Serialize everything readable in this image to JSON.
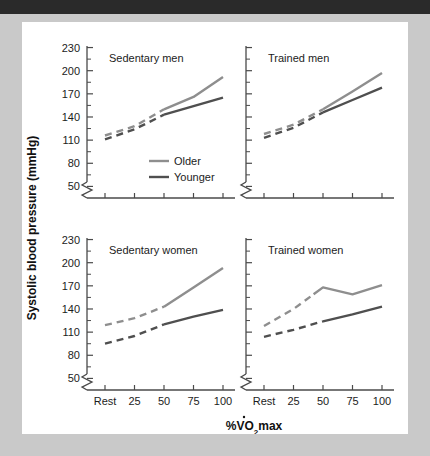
{
  "figure": {
    "y_axis_title": "Systolic blood pressure (mmHg)",
    "x_axis_title_pre": "%V",
    "x_axis_title_v": "V",
    "x_axis_title_mid": "O",
    "x_axis_title_sub": "2",
    "x_axis_title_post": "max"
  },
  "legend": {
    "older_label": "Older",
    "younger_label": "Younger",
    "older_color": "#8e8e8e",
    "younger_color": "#4f4f4f"
  },
  "chart_data": {
    "type": "line",
    "xlabel": "%VO2max",
    "ylabel": "Systolic blood pressure (mmHg)",
    "ylim": [
      35,
      230
    ],
    "y_ticks": [
      50,
      80,
      110,
      140,
      170,
      200,
      230
    ],
    "y_minor_ticks": [
      65,
      95,
      125,
      155,
      185,
      215
    ],
    "y_axis_break": true,
    "grid": false,
    "legend_position": "inside-top-left-panel",
    "x_categories": [
      "Rest",
      "25",
      "50",
      "75",
      "100"
    ],
    "x_values": [
      0,
      25,
      50,
      75,
      100
    ],
    "panels": [
      {
        "id": "sedentary-men",
        "title": "Sedentary men",
        "position": "top-left",
        "series": [
          {
            "name": "Older",
            "color": "#8e8e8e",
            "x": [
              0,
              25,
              50,
              75,
              100
            ],
            "values": [
              116,
              128,
              150,
              166,
              192
            ],
            "dashed_segment_x": [
              0,
              50
            ],
            "solid_segment_x": [
              50,
              100
            ]
          },
          {
            "name": "Younger",
            "color": "#4f4f4f",
            "x": [
              0,
              25,
              50,
              75,
              100
            ],
            "values": [
              111,
              124,
              143,
              154,
              165
            ],
            "dashed_segment_x": [
              0,
              50
            ],
            "solid_segment_x": [
              50,
              100
            ]
          }
        ]
      },
      {
        "id": "trained-men",
        "title": "Trained men",
        "position": "top-right",
        "series": [
          {
            "name": "Older",
            "color": "#8e8e8e",
            "x": [
              0,
              25,
              50,
              75,
              100
            ],
            "values": [
              118,
              130,
              150,
              173,
              197
            ],
            "dashed_segment_x": [
              0,
              50
            ],
            "solid_segment_x": [
              50,
              100
            ]
          },
          {
            "name": "Younger",
            "color": "#4f4f4f",
            "x": [
              0,
              25,
              50,
              75,
              100
            ],
            "values": [
              113,
              126,
              146,
              162,
              178
            ],
            "dashed_segment_x": [
              0,
              50
            ],
            "solid_segment_x": [
              50,
              100
            ]
          }
        ]
      },
      {
        "id": "sedentary-women",
        "title": "Sedentary women",
        "position": "bottom-left",
        "series": [
          {
            "name": "Older",
            "color": "#8e8e8e",
            "x": [
              0,
              25,
              50,
              75,
              100
            ],
            "values": [
              119,
              128,
              143,
              168,
              193
            ],
            "dashed_segment_x": [
              0,
              50
            ],
            "solid_segment_x": [
              50,
              100
            ]
          },
          {
            "name": "Younger",
            "color": "#4f4f4f",
            "x": [
              0,
              25,
              50,
              75,
              100
            ],
            "values": [
              95,
              105,
              120,
              130,
              139
            ],
            "dashed_segment_x": [
              0,
              50
            ],
            "solid_segment_x": [
              50,
              100
            ]
          }
        ]
      },
      {
        "id": "trained-women",
        "title": "Trained women",
        "position": "bottom-right",
        "series": [
          {
            "name": "Older",
            "color": "#8e8e8e",
            "x": [
              0,
              25,
              50,
              75,
              100
            ],
            "values": [
              118,
              140,
              168,
              159,
              171
            ],
            "dashed_segment_x": [
              0,
              42
            ],
            "solid_segment_x": [
              42,
              100
            ]
          },
          {
            "name": "Younger",
            "color": "#4f4f4f",
            "x": [
              0,
              25,
              50,
              75,
              100
            ],
            "values": [
              104,
              113,
              124,
              133,
              143
            ],
            "dashed_segment_x": [
              0,
              50
            ],
            "solid_segment_x": [
              50,
              100
            ]
          }
        ]
      }
    ]
  }
}
